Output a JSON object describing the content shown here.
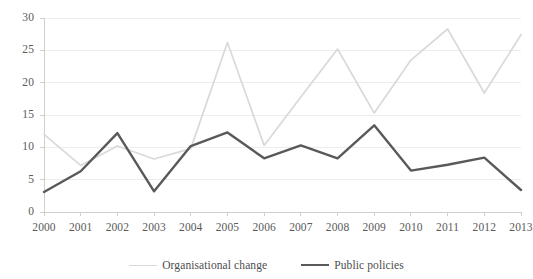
{
  "chart_data": {
    "type": "line",
    "title": "",
    "xlabel": "",
    "ylabel": "",
    "categories": [
      "2000",
      "2001",
      "2002",
      "2003",
      "2004",
      "2005",
      "2006",
      "2007",
      "2008",
      "2009",
      "2010",
      "2011",
      "2012",
      "2013"
    ],
    "series": [
      {
        "name": "Organisational change",
        "color": "#D9D9D9",
        "values": [
          12.0,
          7.2,
          10.2,
          8.2,
          9.8,
          26.2,
          10.3,
          17.8,
          25.2,
          15.3,
          23.5,
          28.3,
          18.4,
          27.4
        ]
      },
      {
        "name": "Public policies",
        "color": "#595959",
        "values": [
          3.1,
          6.3,
          12.2,
          3.2,
          10.2,
          12.3,
          8.3,
          10.3,
          8.3,
          13.4,
          6.4,
          7.3,
          8.4,
          3.4
        ]
      }
    ],
    "ylim": [
      0,
      30
    ],
    "yticks": [
      0,
      5,
      10,
      15,
      20,
      25,
      30
    ],
    "ytick_labels": [
      "0",
      "5",
      "10",
      "15",
      "20",
      "25",
      "30"
    ],
    "grid": true,
    "grid_color": "#EDEDED",
    "axis_color": "#D0D0D0",
    "legend_position": "bottom"
  }
}
